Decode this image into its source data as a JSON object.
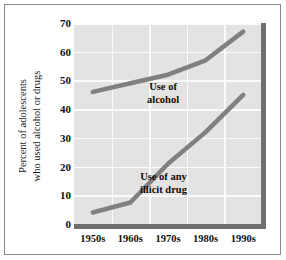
{
  "figure": {
    "background_color": "#ffffff",
    "border_color": "#888888",
    "plot_background_color": "#e3e3e3",
    "gridline_color": "#fbfbfb",
    "line_color": "#808080",
    "axis_bar_color": "#6f6f6f"
  },
  "chart_data": {
    "type": "line",
    "title": "",
    "xlabel": "",
    "ylabel": "Percent of adolescents who used alcohol or drugs",
    "ylabel_line1": "Percent of adolescents",
    "ylabel_line2": "who used alcohol or drugs",
    "categories": [
      "1950s",
      "1960s",
      "1970s",
      "1980s",
      "1990s"
    ],
    "yticks": [
      0,
      10,
      20,
      30,
      40,
      50,
      60,
      70
    ],
    "ylim": [
      0,
      70
    ],
    "grid": true,
    "legend_position": "inline-annotations",
    "series": [
      {
        "name": "Use of alcohol",
        "label_line1": "Use of",
        "label_line2": "alcohol",
        "color": "#808080",
        "values": [
          46,
          49,
          52,
          57,
          67
        ]
      },
      {
        "name": "Use of any illicit drug",
        "label_line1": "Use of any",
        "label_line2": "illicit drug",
        "color": "#808080",
        "values": [
          4,
          7.5,
          21,
          32,
          45
        ]
      }
    ]
  }
}
